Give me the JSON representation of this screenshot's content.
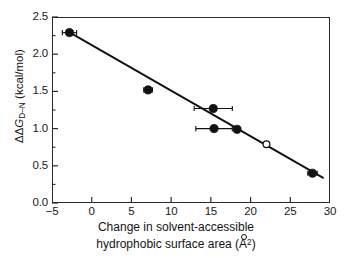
{
  "chart_data": {
    "type": "scatter",
    "title": "",
    "xlabel": "Change in solvent-accessible hydrophobic surface area (Å²)",
    "xlabel_line1": "Change in solvent-accessible",
    "xlabel_line2_pre": "hydrophobic surface area (A",
    "xlabel_line2_sup": "2",
    "xlabel_line2_post": ")",
    "ylabel": "ΔΔG D→N (kcal/mol)",
    "ylabel_pre": "ΔΔ",
    "ylabel_italic": "G",
    "ylabel_sub": "D–N",
    "ylabel_post": " (kcal/mol)",
    "xlim": [
      -5,
      30
    ],
    "ylim": [
      0.0,
      2.5
    ],
    "xticks": [
      -5,
      0,
      5,
      10,
      15,
      20,
      25,
      30
    ],
    "xtick_labels": [
      "−5",
      "0",
      "5",
      "10",
      "15",
      "20",
      "25",
      "30"
    ],
    "yticks": [
      0.0,
      0.5,
      1.0,
      1.5,
      2.0,
      2.5
    ],
    "ytick_labels": [
      "0.0",
      "0.5",
      "1.0",
      "1.5",
      "2.0",
      "2.5"
    ],
    "y_minor_ticks": [
      0.25,
      0.75,
      1.25,
      1.75,
      2.25
    ],
    "grid": false,
    "legend": false,
    "tick_direction": "in",
    "marker_color": "#111111",
    "line_color": "#111111",
    "frame_color": "#2a2a2a",
    "points": [
      {
        "x": -2.8,
        "y": 2.29,
        "xerr": 0.9,
        "filled": true
      },
      {
        "x": 7.1,
        "y": 1.52,
        "xerr": 0.55,
        "filled": true
      },
      {
        "x": 15.3,
        "y": 1.27,
        "xerr": 2.4,
        "filled": true
      },
      {
        "x": 15.4,
        "y": 1.0,
        "xerr": 2.3,
        "filled": true
      },
      {
        "x": 18.3,
        "y": 0.99,
        "xerr": 0.0,
        "filled": true
      },
      {
        "x": 22.0,
        "y": 0.79,
        "xerr": 0.0,
        "filled": false
      },
      {
        "x": 27.8,
        "y": 0.4,
        "xerr": 0.6,
        "filled": true
      }
    ],
    "fit_line": {
      "x0": -2.9,
      "y0": 2.3,
      "x1": 29.2,
      "y1": 0.335,
      "slope": -0.0612,
      "intercept": 2.122
    }
  }
}
